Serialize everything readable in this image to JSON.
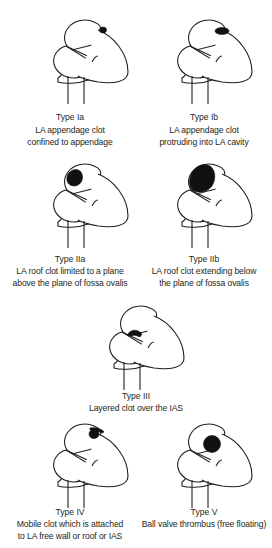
{
  "figure": {
    "panels": [
      {
        "id": "Ia",
        "type_label": "Type Ia",
        "description": [
          "LA appendage clot",
          "confined to appendage"
        ],
        "clot": "small clot inside LA appendage tip"
      },
      {
        "id": "Ib",
        "type_label": "Type Ib",
        "description": [
          "LA appendage clot",
          "protruding into LA cavity"
        ],
        "clot": "elongated clot from appendage into cavity"
      },
      {
        "id": "IIa",
        "type_label": "Type IIa",
        "description": [
          "LA roof clot limited to a plane",
          "above the plane of fossa ovalis"
        ],
        "clot": "roof clot above septal plane"
      },
      {
        "id": "IIb",
        "type_label": "Type IIb",
        "description": [
          "LA roof clot extending below",
          "the plane of fossa ovalis"
        ],
        "clot": "large roof clot extending down"
      },
      {
        "id": "III",
        "type_label": "Type III",
        "description": [
          "Layered clot over the IAS"
        ],
        "clot": "thin layered clot along interatrial septum"
      },
      {
        "id": "IV",
        "type_label": "Type IV",
        "description": [
          "Mobile clot which is attached",
          "to LA free wall or roof or IAS"
        ],
        "clot": "pedunculated mobile clot"
      },
      {
        "id": "V",
        "type_label": "Type V",
        "description": [
          "Ball valve thrombus (free floating)"
        ],
        "clot": "free floating round thrombus"
      }
    ],
    "colors": {
      "line": "#231f20",
      "clot": "#111111",
      "background": "#ffffff"
    }
  }
}
